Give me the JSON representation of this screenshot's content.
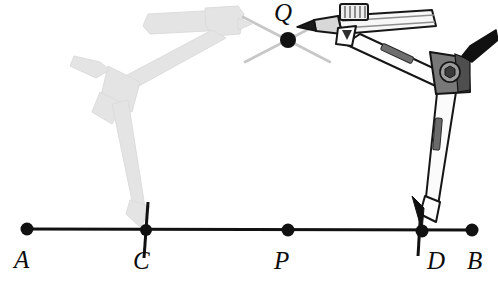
{
  "figure": {
    "type": "geometric-construction-diagram",
    "background_color": "#ffffff",
    "ink_color": "#111111",
    "ghost_color": "#e2e2e2",
    "arc_color": "#c9c9c9",
    "metal_light": "#f2f2f2",
    "metal_mid": "#9a9a9a",
    "metal_dark": "#4a4a4a",
    "labels": {
      "A": "A",
      "B": "B",
      "C": "C",
      "D": "D",
      "P": "P",
      "Q": "Q"
    },
    "points": [
      {
        "name": "A",
        "label": "A",
        "x": 27,
        "y": 229,
        "on_line": true,
        "has_dot": true,
        "has_tick": false
      },
      {
        "name": "C",
        "label": "C",
        "x": 146,
        "y": 230,
        "on_line": true,
        "has_dot": true,
        "has_tick": true
      },
      {
        "name": "P",
        "label": "P",
        "x": 288,
        "y": 230,
        "on_line": true,
        "has_dot": true,
        "has_tick": false
      },
      {
        "name": "D",
        "label": "D",
        "x": 422,
        "y": 231,
        "on_line": true,
        "has_dot": true,
        "has_tick": true
      },
      {
        "name": "B",
        "label": "B",
        "x": 472,
        "y": 230,
        "on_line": true,
        "has_dot": true,
        "has_tick": false
      },
      {
        "name": "Q",
        "label": "Q",
        "x": 288,
        "y": 40,
        "on_line": false,
        "has_dot": true,
        "has_tick": false
      }
    ],
    "line": {
      "name": "line-AB",
      "x1": 27,
      "y1": 229,
      "x2": 472,
      "y2": 230,
      "stroke_width": 3
    },
    "arcs": [
      {
        "name": "arc-from-C",
        "note": "light arc stroke through Q rising to the right"
      },
      {
        "name": "arc-from-D",
        "note": "light arc stroke through Q rising to the left"
      }
    ],
    "compass_active": {
      "name": "compass-active",
      "needle_point": "D",
      "pencil_point": "Q",
      "description": "compass with needle leg set at D and pencil leg marking Q"
    },
    "compass_ghost": {
      "name": "compass-ghost",
      "needle_point": "C",
      "description": "faded previous compass position with needle at C"
    }
  }
}
